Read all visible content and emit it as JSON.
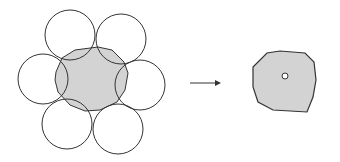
{
  "diagram": {
    "width": 340,
    "height": 162,
    "colors": {
      "stroke": "#333333",
      "fill": "#d3d3d3",
      "background": "#ffffff"
    },
    "left_figure": {
      "shaded_region": {
        "points": "56,72 62,58 75,50 98,47 112,50 124,62 128,73 125,90 117,102 100,110 85,111 70,105 58,92 55,80"
      },
      "circles": [
        {
          "name": "circle-top-left",
          "cx": 70,
          "cy": 35,
          "r": 25
        },
        {
          "name": "circle-top-right",
          "cx": 121,
          "cy": 39,
          "r": 25
        },
        {
          "name": "circle-right",
          "cx": 140,
          "cy": 85,
          "r": 25
        },
        {
          "name": "circle-bottom-right",
          "cx": 118,
          "cy": 129,
          "r": 25
        },
        {
          "name": "circle-bottom-left",
          "cx": 67,
          "cy": 124,
          "r": 25
        },
        {
          "name": "circle-left",
          "cx": 43,
          "cy": 79,
          "r": 25
        }
      ]
    },
    "arrow": {
      "x1": 190,
      "y1": 83,
      "x2": 221,
      "y2": 83
    },
    "right_figure": {
      "polygon": {
        "points": "253,67 267,53 280,51 305,53 314,62 316,80 313,97 307,112 273,110 258,102 253,87"
      },
      "center_marker": {
        "cx": 285,
        "cy": 76,
        "r": 3
      }
    }
  }
}
